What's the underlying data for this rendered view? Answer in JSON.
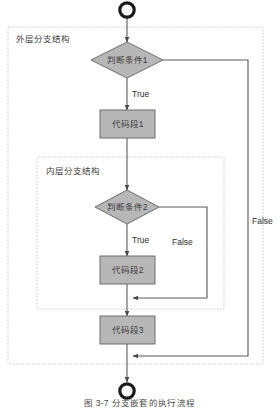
{
  "figure": {
    "caption": "图 3-7  分支嵌套的执行流程",
    "background": "#ffffff"
  },
  "colors": {
    "shape_fill": "#b7b7b7",
    "shape_stroke": "#6d6d6d",
    "connector": "#5a5a5a",
    "container_border": "#c9c9c9",
    "terminator_stroke": "#1a1a1a",
    "text": "#3b3b3b"
  },
  "containers": [
    {
      "id": "outer",
      "label": "外层分支结构"
    },
    {
      "id": "inner",
      "label": "内层分支结构"
    }
  ],
  "nodes": [
    {
      "id": "start",
      "type": "terminator",
      "label": ""
    },
    {
      "id": "cond1",
      "type": "decision",
      "label": "判断条件1"
    },
    {
      "id": "code1",
      "type": "process",
      "label": "代码段1"
    },
    {
      "id": "cond2",
      "type": "decision",
      "label": "判断条件2"
    },
    {
      "id": "code2",
      "type": "process",
      "label": "代码段2"
    },
    {
      "id": "code3",
      "type": "process",
      "label": "代码段3"
    },
    {
      "id": "end",
      "type": "terminator",
      "label": ""
    }
  ],
  "edges": [
    {
      "from": "start",
      "to": "cond1",
      "label": ""
    },
    {
      "from": "cond1",
      "to": "code1",
      "label": "True"
    },
    {
      "from": "cond1",
      "to": "end",
      "label": "False"
    },
    {
      "from": "code1",
      "to": "cond2",
      "label": ""
    },
    {
      "from": "cond2",
      "to": "code2",
      "label": "True"
    },
    {
      "from": "cond2",
      "to": "code3",
      "label": "False"
    },
    {
      "from": "code2",
      "to": "code3",
      "label": ""
    },
    {
      "from": "code3",
      "to": "end",
      "label": ""
    }
  ],
  "edge_labels": {
    "outer_true": "True",
    "outer_false": "False",
    "inner_true": "True",
    "inner_false": "False"
  }
}
